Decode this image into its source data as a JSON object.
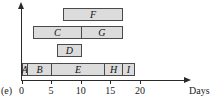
{
  "figure": {
    "panel_label": "(e)",
    "axis_title": "Days",
    "type": "gantt"
  },
  "chart_data": {
    "type": "bar",
    "orientation": "horizontal",
    "title": "",
    "xlabel": "Days",
    "ylabel": "",
    "xlim": [
      0,
      21
    ],
    "grid": false,
    "legend": null,
    "xticks": [
      0,
      5,
      10,
      15,
      20
    ],
    "xtick_labels": [
      "0",
      "5",
      "10",
      "15",
      "20"
    ],
    "rows": [
      {
        "row": 0,
        "tasks": [
          {
            "name": "F",
            "start": 7,
            "end": 17,
            "duration": 10
          }
        ]
      },
      {
        "row": 1,
        "tasks": [
          {
            "name": "C",
            "start": 2,
            "end": 10,
            "duration": 8
          },
          {
            "name": "G",
            "start": 10,
            "end": 17,
            "duration": 7
          }
        ]
      },
      {
        "row": 2,
        "tasks": [
          {
            "name": "D",
            "start": 6,
            "end": 10,
            "duration": 4
          }
        ]
      },
      {
        "row": 3,
        "tasks": [
          {
            "name": "A",
            "start": 0,
            "end": 1,
            "duration": 1
          },
          {
            "name": "B",
            "start": 1,
            "end": 5,
            "duration": 4
          },
          {
            "name": "E",
            "start": 5,
            "end": 14,
            "duration": 9
          },
          {
            "name": "H",
            "start": 14,
            "end": 17,
            "duration": 3
          },
          {
            "name": "I",
            "start": 17,
            "end": 19,
            "duration": 2
          }
        ]
      }
    ],
    "colors": {
      "bar_fill": "#dcdcdc",
      "bar_stroke": "#4a4a4a",
      "axis": "#2a2a2a",
      "text": "#1a1a1a"
    }
  }
}
